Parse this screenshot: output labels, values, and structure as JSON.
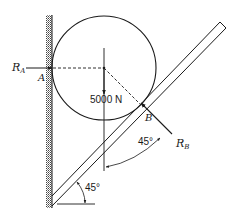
{
  "figure": {
    "colors": {
      "ink": "#1a1a1a",
      "background": "#ffffff",
      "hatch": "#555555"
    },
    "labels": {
      "reaction_a_main": "R",
      "reaction_a_sub": "A",
      "point_a": "A",
      "point_b": "B",
      "weight": "5000 N",
      "reaction_b_main": "R",
      "reaction_b_sub": "B",
      "angle_top": "45°",
      "angle_bottom": "45°"
    },
    "elements": {
      "wall": "vertical hatched wall on left",
      "cylinder": "circle tangent to wall at A and plank at B",
      "plank": "inclined plank at 45° from horizontal",
      "force_ra": "horizontal arrow pointing right into A",
      "force_weight": "downward arrow from cylinder center",
      "force_rb": "arrow at B perpendicular to plank, pointing down-right"
    }
  }
}
